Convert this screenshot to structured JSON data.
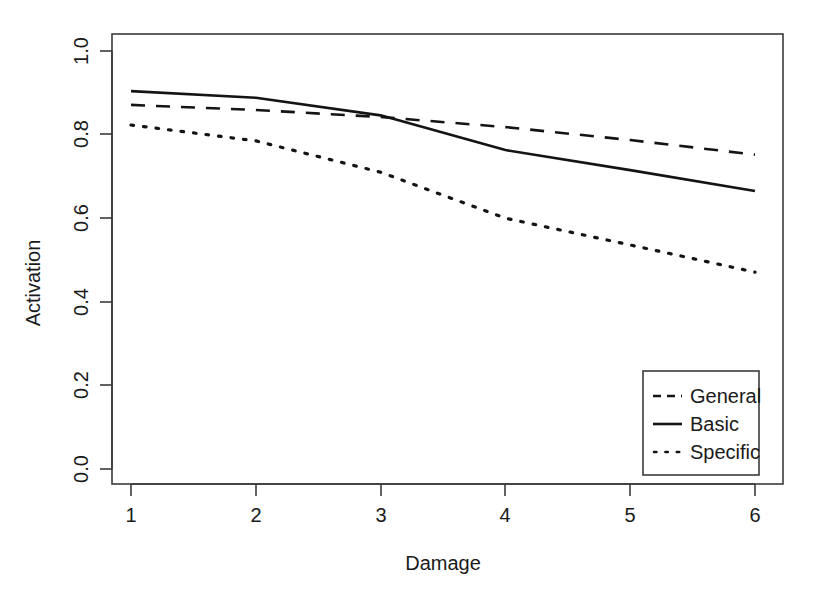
{
  "chart_data": {
    "type": "line",
    "title": "",
    "xlabel": "Damage",
    "ylabel": "Activation",
    "x": [
      1,
      2,
      3,
      4,
      5,
      6
    ],
    "xticklabels": [
      "1",
      "2",
      "3",
      "4",
      "5",
      "6"
    ],
    "yticks": [
      0.0,
      0.2,
      0.4,
      0.6,
      0.8,
      1.0
    ],
    "yticklabels": [
      "0.0",
      "0.2",
      "0.4",
      "0.6",
      "0.8",
      "1.0"
    ],
    "xlim": [
      1,
      6
    ],
    "ylim": [
      0.0,
      1.0
    ],
    "grid": false,
    "legend_position": "bottom-right",
    "series": [
      {
        "name": "General",
        "style": "dashed",
        "color": "#141414",
        "values": [
          0.871,
          0.859,
          0.842,
          0.818,
          0.787,
          0.752
        ]
      },
      {
        "name": "Basic",
        "style": "solid",
        "color": "#141414",
        "values": [
          0.904,
          0.888,
          0.846,
          0.763,
          0.715,
          0.665
        ]
      },
      {
        "name": "Specific",
        "style": "dotted",
        "color": "#141414",
        "values": [
          0.823,
          0.785,
          0.71,
          0.6,
          0.536,
          0.471
        ]
      }
    ]
  },
  "axes": {
    "x_title": "Damage",
    "y_title": "Activation"
  },
  "legend": {
    "entries": [
      {
        "label": "General",
        "style": "dashed"
      },
      {
        "label": "Basic",
        "style": "solid"
      },
      {
        "label": "Specific",
        "style": "dotted"
      }
    ]
  }
}
